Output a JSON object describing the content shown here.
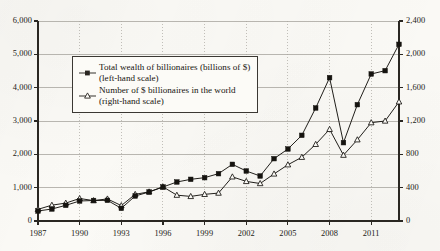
{
  "chart_data": {
    "type": "line",
    "title": "",
    "subtitle": "",
    "xlabel": "",
    "ylabel": "",
    "grid": "horizontal-solid-vertical-dotted",
    "legend_position": "upper-left-inside",
    "x": [
      1987,
      1988,
      1989,
      1990,
      1991,
      1992,
      1993,
      1994,
      1995,
      1996,
      1997,
      1998,
      1999,
      2000,
      2001,
      2002,
      2003,
      2004,
      2005,
      2006,
      2007,
      2008,
      2009,
      2010,
      2011,
      2012,
      2013
    ],
    "xtick_labels": [
      "1987",
      "1990",
      "1993",
      "1996",
      "1999",
      "2002",
      "2005",
      "2008",
      "2011"
    ],
    "xtick_values": [
      1987,
      1990,
      1993,
      1996,
      1999,
      2002,
      2005,
      2008,
      2011
    ],
    "xlim": [
      1987,
      2013
    ],
    "axes": [
      {
        "id": "left",
        "name": "left-hand scale",
        "ylim": [
          0,
          6000
        ],
        "ytick_labels": [
          "0",
          "1,000",
          "2,000",
          "3,000",
          "4,000",
          "5,000",
          "6,000"
        ],
        "ytick_values": [
          0,
          1000,
          2000,
          3000,
          4000,
          5000,
          6000
        ]
      },
      {
        "id": "right",
        "name": "right-hand scale",
        "ylim": [
          0,
          2400
        ],
        "ytick_labels": [
          "0",
          "400",
          "800",
          "1,200",
          "1,600",
          "2,000",
          "2,400"
        ],
        "ytick_values": [
          0,
          400,
          800,
          1200,
          1600,
          2000,
          2400
        ]
      }
    ],
    "series": [
      {
        "name": "Total wealth of billionaires (billions of $)",
        "scale": "left",
        "marker": "filled-square",
        "color": "#15130f",
        "values": [
          300,
          360,
          470,
          600,
          615,
          620,
          380,
          750,
          870,
          1020,
          1170,
          1250,
          1300,
          1420,
          1700,
          1500,
          1350,
          1870,
          2160,
          2570,
          3390,
          4300,
          2350,
          3490,
          4410,
          4510,
          5300
        ]
      },
      {
        "name": "Number of $ billionaires in the world",
        "scale": "right",
        "marker": "open-triangle",
        "color": "#15130f",
        "values": [
          140,
          190,
          215,
          270,
          245,
          265,
          185,
          320,
          350,
          410,
          310,
          295,
          320,
          335,
          530,
          475,
          450,
          565,
          675,
          765,
          920,
          1100,
          790,
          975,
          1180,
          1200,
          1430
        ]
      }
    ]
  },
  "legend": {
    "entries": [
      {
        "marker_name": "filled-square-marker",
        "line1": "Total wealth of billionaires (billions of $)",
        "line2": "(left-hand scale)"
      },
      {
        "marker_name": "open-triangle-marker",
        "line1": "Number of $ billionaires in the world",
        "line2": "(right-hand scale)"
      }
    ]
  }
}
